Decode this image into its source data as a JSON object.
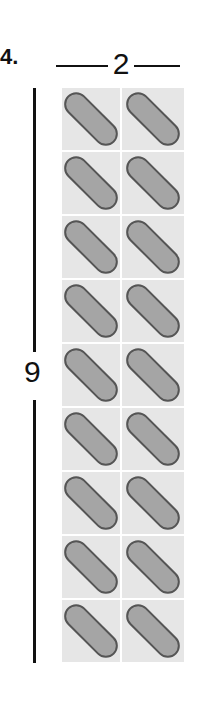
{
  "problem": {
    "number": "4.",
    "columns_label": "2",
    "rows_label": "9",
    "columns": 2,
    "rows": 9,
    "item_icon": "pill-capsule-icon",
    "colors": {
      "cell_background": "#e6e6e6",
      "pill_fill": "#a5a5a5",
      "pill_outline": "#555555",
      "lines": "#111111"
    }
  }
}
